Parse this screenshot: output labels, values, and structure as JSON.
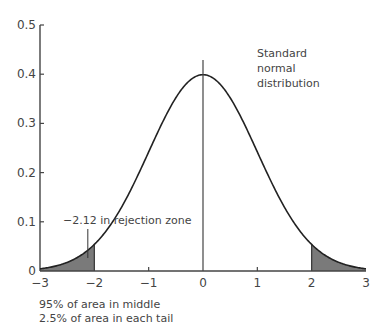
{
  "chart_data": {
    "type": "area",
    "title": "Standard normal distribution",
    "xlabel": "",
    "ylabel": "",
    "xlim": [
      -3,
      3
    ],
    "ylim": [
      0,
      0.5
    ],
    "x_ticks": [
      "−3",
      "−2",
      "−1",
      "0",
      "1",
      "2",
      "3"
    ],
    "y_ticks": [
      "0",
      "0.1",
      "0.2",
      "0.3",
      "0.4",
      "0.5"
    ],
    "grid": false,
    "series": [
      {
        "name": "Standard normal distribution",
        "x": [
          -3,
          -2.5,
          -2,
          -1.5,
          -1,
          -0.5,
          0,
          0.5,
          1,
          1.5,
          2,
          2.5,
          3
        ],
        "values": [
          0.004,
          0.018,
          0.054,
          0.13,
          0.242,
          0.352,
          0.399,
          0.352,
          0.242,
          0.13,
          0.054,
          0.018,
          0.004
        ]
      }
    ],
    "shaded_regions": [
      {
        "from": -3,
        "to": -2,
        "label": "lower rejection tail"
      },
      {
        "from": 2,
        "to": 3,
        "label": "upper rejection tail"
      }
    ],
    "vertical_lines": [
      0
    ],
    "annotations": [
      {
        "text": "Standard",
        "x": 1.0,
        "y": 0.41
      },
      {
        "text": "normal",
        "x": 1.0,
        "y": 0.385
      },
      {
        "text": "distribution",
        "x": 1.0,
        "y": 0.36
      },
      {
        "text": "−2.12 in rejection zone",
        "x": -2.12,
        "y": 0.075
      }
    ],
    "caption": [
      "95% of area in middle",
      "2.5% of area in each tail"
    ]
  },
  "labels": {
    "title_line1": "Standard",
    "title_line2": "normal",
    "title_line3": "distribution",
    "rejection_annotation": "−2.12 in rejection zone",
    "caption_line1": "95% of area in middle",
    "caption_line2": "2.5% of area in each tail",
    "x_ticks": [
      "−3",
      "−2",
      "−1",
      "0",
      "1",
      "2",
      "3"
    ],
    "y_ticks": [
      "0",
      "0.1",
      "0.2",
      "0.3",
      "0.4",
      "0.5"
    ]
  },
  "colors": {
    "curve": "#222222",
    "shade": "#7a7a7a",
    "axis": "#444444"
  }
}
